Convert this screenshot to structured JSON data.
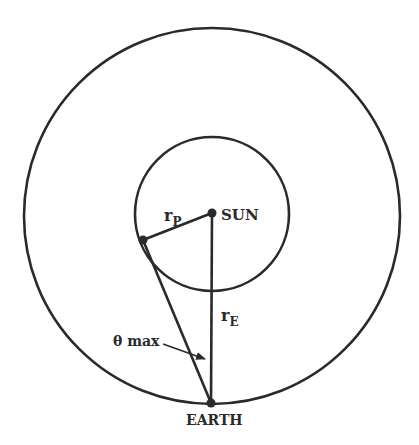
{
  "diagram": {
    "labels": {
      "sun": "SUN",
      "earth": "EARTH",
      "planet_radius_main": "r",
      "planet_radius_sub": "P",
      "earth_radius_main": "r",
      "earth_radius_sub": "E",
      "angle": "θ max"
    },
    "colors": {
      "stroke": "#2a2a2a",
      "background": "#ffffff"
    },
    "geometry": {
      "sun": [
        212,
        214
      ],
      "planet": [
        143,
        240
      ],
      "earth": [
        211,
        403
      ],
      "inner_orbit_radius": 77,
      "outer_orbit_radius": 188
    }
  }
}
